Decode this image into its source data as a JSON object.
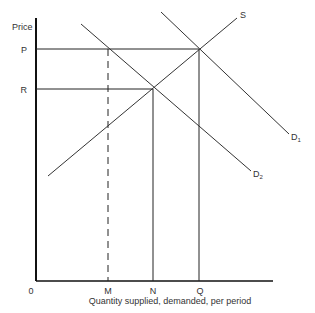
{
  "diagram": {
    "type": "supply-demand",
    "y_axis_label": "Price",
    "x_axis_label": "Quantity supplied, demanded, per period",
    "origin_label": "0",
    "price_levels": [
      {
        "label": "P"
      },
      {
        "label": "R"
      }
    ],
    "quantity_levels": [
      {
        "label": "M",
        "style": "dashed"
      },
      {
        "label": "N",
        "style": "solid"
      },
      {
        "label": "Q",
        "style": "solid"
      }
    ],
    "curves": [
      {
        "label": "S",
        "kind": "supply"
      },
      {
        "label": "D",
        "subscript": "1",
        "kind": "demand"
      },
      {
        "label": "D",
        "subscript": "2",
        "kind": "demand"
      }
    ],
    "equilibria": [
      {
        "curves": [
          "S",
          "D1"
        ],
        "price": "P",
        "quantity": "Q"
      },
      {
        "curves": [
          "S",
          "D2"
        ],
        "price": "R",
        "quantity": "N"
      },
      {
        "curves": [
          "D2"
        ],
        "price": "P",
        "quantity": "M"
      }
    ]
  }
}
